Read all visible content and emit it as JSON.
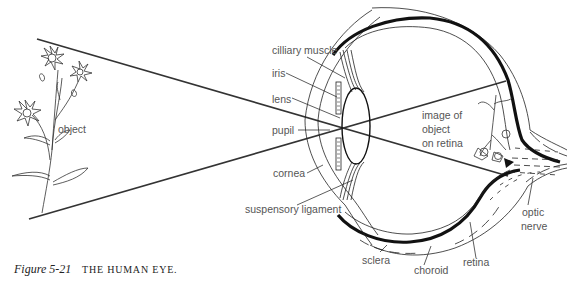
{
  "figure": {
    "number": "Figure 5-21",
    "title": "THE HUMAN EYE."
  },
  "labels": {
    "object": "object",
    "cilliary_muscle": "cilliary muscle",
    "iris": "iris",
    "lens": "lens",
    "pupil": "pupil",
    "cornea": "cornea",
    "suspensory_ligament": "suspensory ligament",
    "image_line1": "image of",
    "image_line2": "object",
    "image_line3": "on retina",
    "sclera": "sclera",
    "choroid": "choroid",
    "retina": "retina",
    "optic_line1": "optic",
    "optic_line2": "nerve"
  }
}
